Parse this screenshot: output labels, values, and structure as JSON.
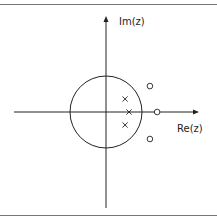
{
  "diagram": {
    "type": "pole-zero plot",
    "x_axis_label": "Re(z)",
    "y_axis_label": "Im(z)",
    "unit_circle_radius": 1,
    "poles": [
      {
        "re": 0.53,
        "im": 0.36
      },
      {
        "re": 0.64,
        "im": 0.0
      },
      {
        "re": 0.53,
        "im": -0.36
      }
    ],
    "zeros": [
      {
        "re": 1.22,
        "im": 0.72
      },
      {
        "re": 1.42,
        "im": 0.0
      },
      {
        "re": 1.22,
        "im": -0.75
      }
    ],
    "pole_symbol": "x",
    "zero_symbol": "o",
    "colors": {
      "line": "#222222",
      "border": "#777777",
      "background": "#ffffff"
    }
  }
}
